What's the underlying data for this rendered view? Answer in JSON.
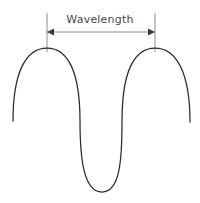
{
  "diagram": {
    "title": "Wavelength",
    "label": {
      "text": "Wavelength",
      "color": "#4a4a4a"
    },
    "colors": {
      "background": "#ffffff",
      "wave_stroke": "#2b2b2b",
      "reference_line": "#8c8c8c",
      "dimension_line": "#8c8c8c",
      "arrow_head": "#3a3a3a"
    },
    "measurement": {
      "name": "wavelength",
      "from_x": 47,
      "to_x": 155,
      "span_px": 108,
      "dimension_line_y": 32
    },
    "reference_lines": [
      {
        "name": "left-crest-marker",
        "x": 47,
        "y_top": 13,
        "y_bottom": 52
      },
      {
        "name": "right-crest-marker",
        "x": 155,
        "y_top": 13,
        "y_bottom": 52
      }
    ],
    "wave": {
      "type": "transverse-wave-curve",
      "crests": [
        {
          "x": 47,
          "y": 48
        },
        {
          "x": 155,
          "y": 48
        }
      ],
      "trough": {
        "x": 102,
        "y": 192
      },
      "tail_left": {
        "x": 13,
        "y": 121
      },
      "tail_right": {
        "x": 190,
        "y": 122
      },
      "path": "M 13 121 C 13 72 26 48 47 48 C 68 48 80 72 80 121 C 80 160 84 192 102 192 C 120 192 122 160 122 121 C 122 72 134 48 155 48 C 176 48 190 72 190 122"
    }
  }
}
